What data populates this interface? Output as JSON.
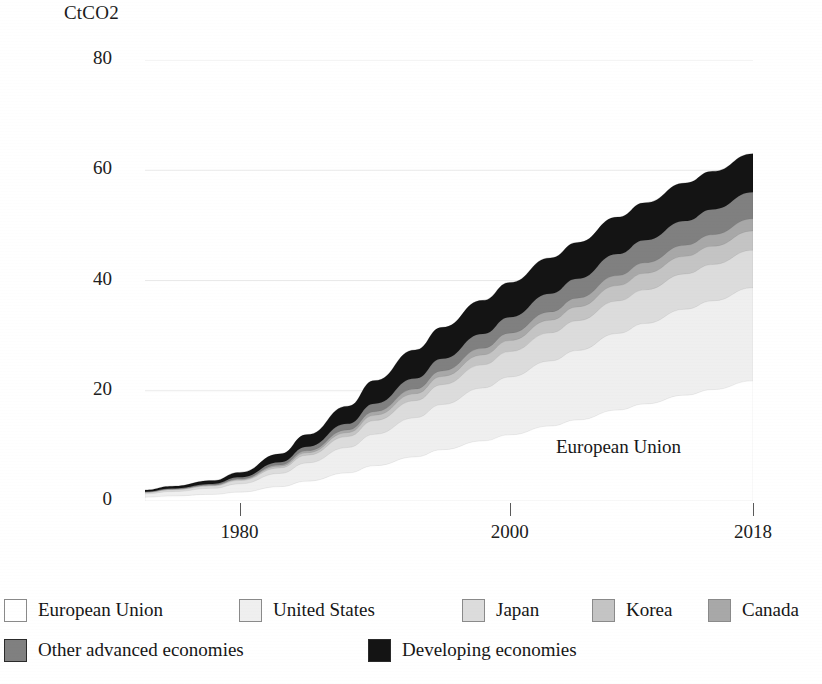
{
  "axis": {
    "y_unit_label": "CtCO2",
    "y_ticks": [
      "80",
      "60",
      "40",
      "20",
      "0"
    ],
    "x_ticks": [
      "1980",
      "2000",
      "2018"
    ]
  },
  "annotations": [
    {
      "text": "European Union"
    }
  ],
  "legend": {
    "rows": [
      [
        {
          "label": "European Union",
          "color": "#ffffff"
        },
        {
          "label": "United States",
          "color": "#efefef"
        },
        {
          "label": "Japan",
          "color": "#dcdcdc"
        },
        {
          "label": "Korea",
          "color": "#c4c4c4"
        },
        {
          "label": "Canada",
          "color": "#a8a8a8"
        }
      ],
      [
        {
          "label": "Other advanced economies",
          "color": "#808080"
        },
        {
          "label": "Developing economies",
          "color": "#141414"
        }
      ]
    ]
  },
  "chart_data": {
    "type": "area",
    "stacked": true,
    "title": "",
    "xlabel": "",
    "ylabel": "CtCO2",
    "ylim": [
      0,
      80
    ],
    "xlim": [
      1973,
      2018
    ],
    "grid": true,
    "gridlines_y": [
      0,
      20,
      40,
      60,
      80
    ],
    "legend_position": "bottom",
    "annotation_label": "European Union",
    "x": [
      1973,
      1975,
      1978,
      1980,
      1983,
      1985,
      1988,
      1990,
      1993,
      1995,
      1998,
      2000,
      2003,
      2005,
      2008,
      2010,
      2013,
      2015,
      2018
    ],
    "series": [
      {
        "name": "European Union",
        "color": "#ffffff",
        "values": [
          0.7,
          0.9,
          1.2,
          1.6,
          2.6,
          3.6,
          5.1,
          6.4,
          8.0,
          9.3,
          10.9,
          12.0,
          13.6,
          14.7,
          16.5,
          17.6,
          19.2,
          20.2,
          21.8
        ]
      },
      {
        "name": "United States",
        "color": "#efefef",
        "values": [
          0.6,
          0.8,
          1.1,
          1.5,
          2.4,
          3.3,
          4.6,
          5.7,
          7.1,
          8.2,
          9.6,
          10.5,
          11.8,
          12.6,
          13.9,
          14.6,
          15.6,
          16.1,
          16.9
        ]
      },
      {
        "name": "Japan",
        "color": "#dcdcdc",
        "values": [
          0.2,
          0.3,
          0.4,
          0.6,
          1.0,
          1.4,
          2.0,
          2.5,
          3.1,
          3.6,
          4.2,
          4.6,
          5.1,
          5.4,
          5.9,
          6.1,
          6.4,
          6.6,
          6.8
        ]
      },
      {
        "name": "Korea",
        "color": "#c4c4c4",
        "values": [
          0.05,
          0.07,
          0.1,
          0.15,
          0.3,
          0.45,
          0.7,
          0.95,
          1.25,
          1.5,
          1.8,
          2.0,
          2.3,
          2.5,
          2.8,
          3.0,
          3.2,
          3.3,
          3.5
        ]
      },
      {
        "name": "Canada",
        "color": "#a8a8a8",
        "values": [
          0.05,
          0.07,
          0.1,
          0.14,
          0.25,
          0.35,
          0.5,
          0.65,
          0.85,
          1.0,
          1.2,
          1.35,
          1.5,
          1.6,
          1.8,
          1.9,
          2.0,
          2.1,
          2.2
        ]
      },
      {
        "name": "Other advanced economies",
        "color": "#808080",
        "values": [
          0.1,
          0.14,
          0.2,
          0.3,
          0.5,
          0.75,
          1.1,
          1.45,
          1.9,
          2.2,
          2.6,
          2.9,
          3.3,
          3.5,
          3.9,
          4.1,
          4.4,
          4.6,
          4.8
        ]
      },
      {
        "name": "Developing economies",
        "color": "#141414",
        "values": [
          0.3,
          0.4,
          0.6,
          0.9,
          1.5,
          2.2,
          3.2,
          4.2,
          5.2,
          5.7,
          6.1,
          6.3,
          6.5,
          6.6,
          6.7,
          6.8,
          6.9,
          6.9,
          7.0
        ]
      }
    ],
    "totals_note": {
      "2018_total": 63.0,
      "2000_total": 33.7,
      "1980_total": 5.2
    }
  }
}
